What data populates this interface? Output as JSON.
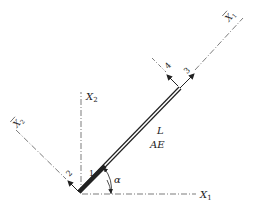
{
  "diagram": {
    "type": "truss bar element with local and global coordinate axes",
    "global_axes": {
      "x1_label": "X",
      "x1_sub": "1",
      "x2_label": "X",
      "x2_sub": "2"
    },
    "local_axes": {
      "x1bar_label": "X",
      "x1bar_sub": "1",
      "x2bar_label": "X",
      "x2bar_sub": "2"
    },
    "bar": {
      "length_label": "L",
      "stiffness_label": "AE"
    },
    "angle_label": "α",
    "dof_labels": [
      "1",
      "2",
      "3",
      "4"
    ],
    "colors": {
      "line": "#222222",
      "background": "#ffffff"
    }
  }
}
